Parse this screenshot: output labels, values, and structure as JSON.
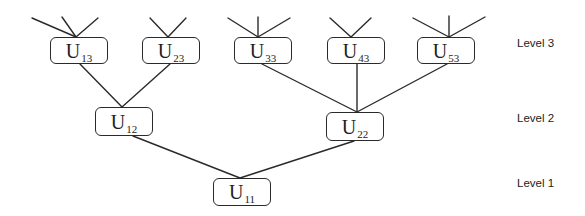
{
  "diagram": {
    "type": "hierarchy-tree",
    "nodes": [
      {
        "id": "U13",
        "letter": "U",
        "subscript": "13",
        "level": 3,
        "x": 50,
        "y": 37,
        "w": 58,
        "h": 27
      },
      {
        "id": "U23",
        "letter": "U",
        "subscript": "23",
        "level": 3,
        "x": 142,
        "y": 37,
        "w": 58,
        "h": 27
      },
      {
        "id": "U33",
        "letter": "U",
        "subscript": "33",
        "level": 3,
        "x": 234,
        "y": 37,
        "w": 58,
        "h": 27
      },
      {
        "id": "U43",
        "letter": "U",
        "subscript": "43",
        "level": 3,
        "x": 327,
        "y": 37,
        "w": 58,
        "h": 27
      },
      {
        "id": "U53",
        "letter": "U",
        "subscript": "53",
        "level": 3,
        "x": 417,
        "y": 37,
        "w": 58,
        "h": 27
      },
      {
        "id": "U12",
        "letter": "U",
        "subscript": "12",
        "level": 2,
        "x": 95,
        "y": 107,
        "w": 58,
        "h": 29
      },
      {
        "id": "U22",
        "letter": "U",
        "subscript": "22",
        "level": 2,
        "x": 326,
        "y": 112,
        "w": 58,
        "h": 29
      },
      {
        "id": "U11",
        "letter": "U",
        "subscript": "11",
        "level": 1,
        "x": 213,
        "y": 178,
        "w": 58,
        "h": 28
      }
    ],
    "edges": [
      {
        "from": "U13",
        "to": "U12"
      },
      {
        "from": "U23",
        "to": "U12"
      },
      {
        "from": "U33",
        "to": "U22"
      },
      {
        "from": "U43",
        "to": "U22"
      },
      {
        "from": "U53",
        "to": "U22"
      },
      {
        "from": "U12",
        "to": "U11"
      },
      {
        "from": "U22",
        "to": "U11"
      }
    ],
    "incoming_stubs": [
      {
        "node": "U13",
        "count": 3
      },
      {
        "node": "U23",
        "count": 2
      },
      {
        "node": "U33",
        "count": 3
      },
      {
        "node": "U43",
        "count": 2
      },
      {
        "node": "U53",
        "count": 3
      }
    ],
    "level_labels": [
      {
        "text": "Level 3",
        "x": 517,
        "y": 37
      },
      {
        "text": "Level 2",
        "x": 517,
        "y": 112
      },
      {
        "text": "Level 1",
        "x": 517,
        "y": 177
      }
    ],
    "colors": {
      "line": "#2a2a2a",
      "text": "#1e1e1e",
      "background": "#ffffff"
    }
  }
}
